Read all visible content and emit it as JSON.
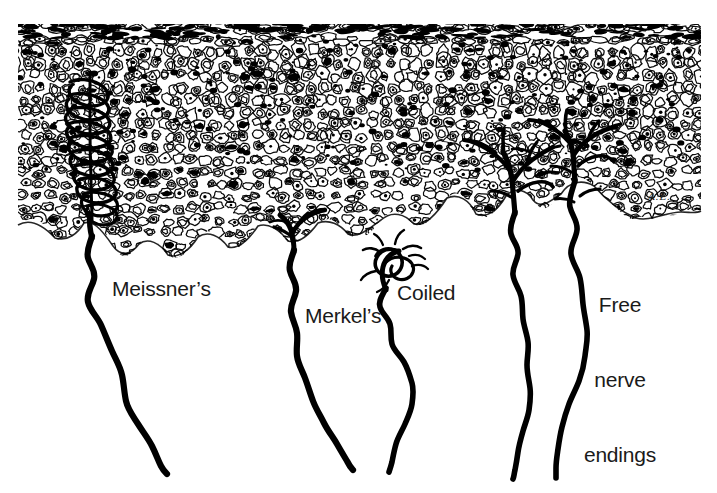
{
  "figure": {
    "background_color": "#ffffff",
    "ink_color": "#000000",
    "label_color": "#1a1a1a",
    "width": 717,
    "height": 493,
    "signature": "A.E."
  },
  "labels": {
    "meissners": "Meissner’s",
    "merkels": "Merkel’s",
    "coiled": "Coiled",
    "free_nerve_endings": "Free\nnerve\nendings",
    "free_nerve_endings_line1": "Free",
    "free_nerve_endings_line2": "nerve",
    "free_nerve_endings_line3": "endings"
  },
  "regions": {
    "epidermis": {
      "name": "epidermis-cell-mass",
      "description": "dense stippled mass of epithelial cells",
      "top": 22,
      "left": 18,
      "right": 701
    },
    "dermis": {
      "name": "dermis-blank-area",
      "description": "blank white area below epidermis containing nerve fibers"
    }
  },
  "receptors": [
    {
      "id": "meissners-corpuscle",
      "label": "Meissner’s",
      "type": "encapsulated lamellated corpuscle",
      "x": 88,
      "y": 150
    },
    {
      "id": "merkels-ending",
      "label": "Merkel’s",
      "type": "branching disc ending at epidermal base",
      "x": 295,
      "y": 225
    },
    {
      "id": "coiled-receptor",
      "label": "Coiled",
      "type": "coiled tangled nerve terminal",
      "x": 392,
      "y": 262
    },
    {
      "id": "free-nerve-endings",
      "label": "Free nerve endings",
      "type": "unmyelinated branching terminals",
      "x": 560,
      "y": 170
    }
  ],
  "nerve_fibers": [
    {
      "id": "fiber-meissners",
      "receptor": "meissners-corpuscle"
    },
    {
      "id": "fiber-merkels",
      "receptor": "merkels-ending"
    },
    {
      "id": "fiber-coiled",
      "receptor": "coiled-receptor"
    },
    {
      "id": "fiber-free-left",
      "receptor": "free-nerve-endings"
    },
    {
      "id": "fiber-free-right",
      "receptor": "free-nerve-endings"
    }
  ]
}
